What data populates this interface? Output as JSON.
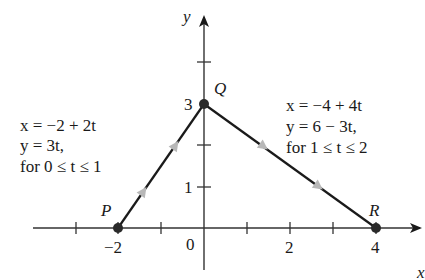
{
  "diagram": {
    "axes": {
      "x_label": "x",
      "y_label": "y",
      "x_ticks": [
        {
          "value": -3,
          "label": ""
        },
        {
          "value": -2,
          "label": "−2"
        },
        {
          "value": -1,
          "label": ""
        },
        {
          "value": 0,
          "label": "0"
        },
        {
          "value": 1,
          "label": ""
        },
        {
          "value": 2,
          "label": "2"
        },
        {
          "value": 3,
          "label": ""
        },
        {
          "value": 4,
          "label": "4"
        }
      ],
      "y_ticks": [
        {
          "value": 1,
          "label": "1"
        },
        {
          "value": 2,
          "label": ""
        },
        {
          "value": 3,
          "label": "3"
        },
        {
          "value": 4,
          "label": ""
        }
      ]
    },
    "points": [
      {
        "name": "P",
        "x": -2,
        "y": 0
      },
      {
        "name": "Q",
        "x": 0,
        "y": 3
      },
      {
        "name": "R",
        "x": 4,
        "y": 0
      }
    ],
    "segments": [
      {
        "from": "P",
        "to": "Q",
        "equations": [
          "x = −2 + 2t",
          "y = 3t,",
          "for 0 ≤ t ≤ 1"
        ]
      },
      {
        "from": "Q",
        "to": "R",
        "equations": [
          "x = −4 + 4t",
          "y = 6 − 3t,",
          "for 1 ≤ t ≤ 2"
        ]
      }
    ],
    "colors": {
      "line": "#1a1a1a",
      "axis": "#333333",
      "direction_arrow": "#b8b8b8",
      "point": "#2a2a2a"
    }
  }
}
